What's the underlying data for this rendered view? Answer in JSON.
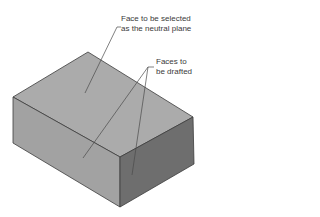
{
  "diagram": {
    "type": "isometric-box-draft-illustration",
    "colors": {
      "top_face": "#ababab",
      "left_face": "#a2a2a2",
      "right_face": "#6e6e6e",
      "edge": "#3c3c3c",
      "leader": "#4a4a4a",
      "background": "#ffffff"
    },
    "callouts": [
      {
        "id": "neutral-plane",
        "lines": [
          "Face to be selected",
          "as the neutral plane"
        ],
        "targets": [
          "top face"
        ]
      },
      {
        "id": "faces-to-draft",
        "lines": [
          "Faces to",
          "be drafted"
        ],
        "targets": [
          "left front face",
          "right front face"
        ]
      }
    ]
  }
}
